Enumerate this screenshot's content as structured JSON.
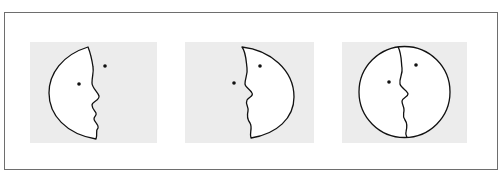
{
  "figure": {
    "colors": {
      "frame": "#6e6e6e",
      "panel_background": "#ececec",
      "face_fill": "#ffffff",
      "stroke": "#111111"
    },
    "panels": [
      {
        "id": "left-crescent-face",
        "label": ""
      },
      {
        "id": "right-crescent-face",
        "label": ""
      },
      {
        "id": "circle-two-faces",
        "label": ""
      }
    ]
  }
}
